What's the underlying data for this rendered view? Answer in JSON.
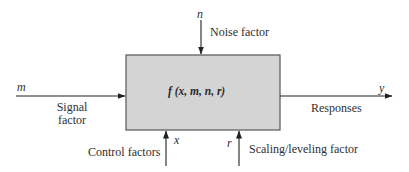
{
  "diagram": {
    "type": "block-diagram",
    "colors": {
      "box_fill": "#d4d4d4",
      "box_stroke": "#555555",
      "arrow": "#222222",
      "text": "#2f2f2f"
    },
    "block": {
      "label": "f (x, m, n, r)"
    },
    "inputs": {
      "signal": {
        "symbol": "m",
        "label_line1": "Signal",
        "label_line2": "factor"
      },
      "noise": {
        "symbol": "n",
        "label": "Noise factor"
      },
      "control": {
        "symbol": "x",
        "label": "Control factors"
      },
      "scaling": {
        "symbol": "r",
        "label": "Scaling/leveling factor"
      }
    },
    "outputs": {
      "response": {
        "symbol": "y",
        "label": "Responses"
      }
    }
  }
}
